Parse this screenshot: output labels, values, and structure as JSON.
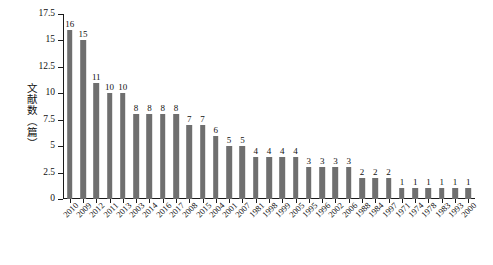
{
  "chart_data": {
    "type": "bar",
    "title": "",
    "subtitle": "",
    "xlabel": "",
    "ylabel": "文献数（篇）",
    "ylim": [
      0,
      17.5
    ],
    "yticks": [
      "0",
      "2.5",
      "5",
      "7.5",
      "10",
      "12.5",
      "15",
      "17.5"
    ],
    "ytick_values": [
      0,
      2.5,
      5,
      7.5,
      10,
      12.5,
      15,
      17.5
    ],
    "grid": false,
    "legend": null,
    "bar_color": "#6f6f6f",
    "axis_color": "#1a1a1a",
    "sorted": "descending",
    "categories": [
      "2010",
      "2009",
      "2012",
      "2011",
      "2013",
      "2003",
      "2014",
      "2016",
      "2017",
      "2008",
      "2015",
      "2004",
      "2001",
      "2007",
      "1981",
      "1998",
      "1999",
      "2005",
      "1995",
      "1996",
      "2002",
      "2006",
      "1988",
      "1984",
      "1997",
      "1971",
      "1974",
      "1978",
      "1983",
      "1993",
      "2000"
    ],
    "values": [
      16,
      15,
      11,
      10,
      10,
      8,
      8,
      8,
      8,
      7,
      7,
      6,
      5,
      5,
      4,
      4,
      4,
      4,
      3,
      3,
      3,
      3,
      2,
      2,
      2,
      1,
      1,
      1,
      1,
      1,
      1
    ],
    "data_labels": [
      "16",
      "15",
      "11",
      "10",
      "10",
      "8",
      "8",
      "8",
      "8",
      "7",
      "7",
      "6",
      "5",
      "5",
      "4",
      "4",
      "4",
      "4",
      "3",
      "3",
      "3",
      "3",
      "2",
      "2",
      "2",
      "1",
      "1",
      "1",
      "1",
      "1",
      "1"
    ]
  },
  "figure": {
    "caption": ""
  }
}
